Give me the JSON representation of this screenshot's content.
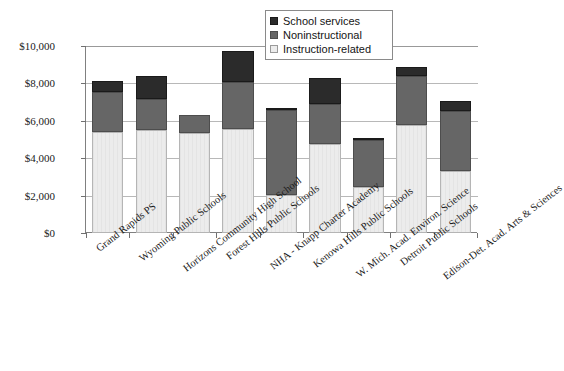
{
  "chart_data": {
    "type": "bar",
    "subtype": "stacked-bar",
    "title": "",
    "subtitle": "",
    "xlabel": "",
    "ylabel": "",
    "ylim": [
      0,
      10000
    ],
    "ytick_values": [
      0,
      2000,
      4000,
      6000,
      8000,
      10000
    ],
    "ytick_labels": [
      "$0",
      "$2,000",
      "$4,000",
      "$6,000",
      "$8,000",
      "$10,000"
    ],
    "grid": true,
    "legend_position": "top-right",
    "categories": [
      "Grand Rapids PS",
      "Wyoming Public Schools",
      "Horizons Community High School",
      "Forest Hills Public Schools",
      "NHA - Knapp Charter Academy",
      "Kenowa Hills Public Schools",
      "W. Mich. Acad. Environ. Science",
      "Detroit Public Schools",
      "Edison-Det. Acad. Arts & Sciences"
    ],
    "series": [
      {
        "name": "Instruction-related",
        "color": "#ececec",
        "values": [
          5400,
          5500,
          5350,
          5550,
          2050,
          4750,
          2450,
          5800,
          3300
        ]
      },
      {
        "name": "Noninstructional",
        "color": "#666666",
        "values": [
          2150,
          1650,
          950,
          2550,
          4550,
          2150,
          2500,
          2600,
          3250
        ]
      },
      {
        "name": "School services",
        "color": "#2b2b2b",
        "values": [
          600,
          1250,
          0,
          1650,
          100,
          1400,
          150,
          500,
          500
        ]
      }
    ],
    "totals": [
      8150,
      8400,
      6300,
      9750,
      6700,
      8300,
      5100,
      8900,
      7050
    ]
  },
  "legend": {
    "entries": [
      {
        "label": "School services",
        "swatch": "dark-square-swatch"
      },
      {
        "label": "Noninstructional",
        "swatch": "gray-square-swatch"
      },
      {
        "label": "Instruction-related",
        "swatch": "light-square-swatch"
      }
    ]
  },
  "colors": {
    "instruction_related": "#ececec",
    "noninstructional": "#666666",
    "school_services": "#2b2b2b",
    "gridline": "#b8b8b8",
    "axis": "#808080",
    "text": "#1a1a1a"
  }
}
